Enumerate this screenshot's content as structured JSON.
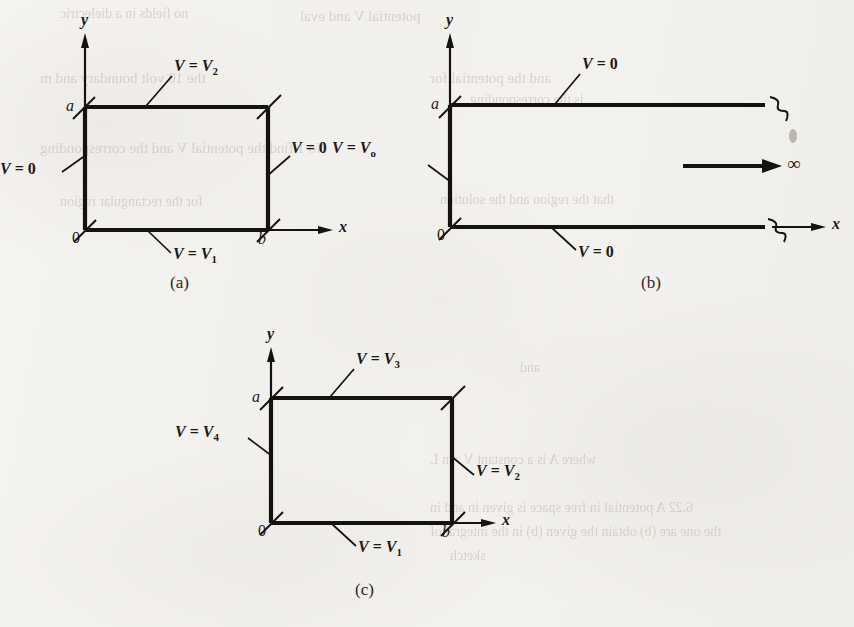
{
  "figure": {
    "type": "diagram",
    "ink_color": "#151311",
    "paper_color": "#f4f2ee"
  },
  "panels": [
    {
      "id": "a",
      "caption": "(a)",
      "axes": {
        "x_label": "x",
        "y_label": "y",
        "origin_label": "0"
      },
      "ticks": {
        "x_right": "b",
        "y_top": "a"
      },
      "region": {
        "shape": "rectangle",
        "width_symbol": "b",
        "height_symbol": "a"
      },
      "boundaries": [
        {
          "side": "bottom",
          "label_V": "V",
          "label_eq": " = ",
          "label_value": "V",
          "label_sub": "1",
          "text": "V = V1"
        },
        {
          "side": "top",
          "label_V": "V",
          "label_eq": " = ",
          "label_value": "V",
          "label_sub": "2",
          "text": "V = V2"
        },
        {
          "side": "left",
          "label_V": "V",
          "label_eq": " = ",
          "label_value": "0",
          "label_sub": "",
          "text": "V = 0"
        },
        {
          "side": "right",
          "label_V": "V",
          "label_eq": " = ",
          "label_value": "0",
          "label_sub": "",
          "text": "V = 0"
        }
      ]
    },
    {
      "id": "b",
      "caption": "(b)",
      "axes": {
        "x_label": "x",
        "y_label": "y",
        "origin_label": "0"
      },
      "ticks": {
        "x_right": "",
        "y_top": "a"
      },
      "region": {
        "shape": "semi-infinite-strip",
        "height_symbol": "a",
        "extent_label": "∞"
      },
      "boundaries": [
        {
          "side": "bottom",
          "label_V": "V",
          "label_eq": " = ",
          "label_value": "0",
          "label_sub": "",
          "text": "V = 0"
        },
        {
          "side": "top",
          "label_V": "V",
          "label_eq": " = ",
          "label_value": "0",
          "label_sub": "",
          "text": "V = 0"
        },
        {
          "side": "left",
          "label_V": "V",
          "label_eq": " = ",
          "label_value": "V",
          "label_sub": "o",
          "text": "V = Vo"
        }
      ]
    },
    {
      "id": "c",
      "caption": "(c)",
      "axes": {
        "x_label": "x",
        "y_label": "y",
        "origin_label": "0"
      },
      "ticks": {
        "x_right": "b",
        "y_top": "a"
      },
      "region": {
        "shape": "rectangle",
        "width_symbol": "b",
        "height_symbol": "a"
      },
      "boundaries": [
        {
          "side": "bottom",
          "label_V": "V",
          "label_eq": " = ",
          "label_value": "V",
          "label_sub": "1",
          "text": "V = V1"
        },
        {
          "side": "right",
          "label_V": "V",
          "label_eq": " = ",
          "label_value": "V",
          "label_sub": "2",
          "text": "V = V2"
        },
        {
          "side": "top",
          "label_V": "V",
          "label_eq": " = ",
          "label_value": "V",
          "label_sub": "3",
          "text": "V = V3"
        },
        {
          "side": "left",
          "label_V": "V",
          "label_eq": " = ",
          "label_value": "V",
          "label_sub": "4",
          "text": "V = V4"
        }
      ]
    }
  ],
  "ghost_text": [
    {
      "text": "potential V and eval",
      "x": 300,
      "y": 8,
      "size": 15
    },
    {
      "text": "no fields in a dielectric",
      "x": 60,
      "y": 6,
      "size": 14
    },
    {
      "text": "the 10 volt boundary and m",
      "x": 40,
      "y": 70,
      "size": 15
    },
    {
      "text": "and the potential for",
      "x": 430,
      "y": 70,
      "size": 15
    },
    {
      "text": "is the corresponding",
      "x": 470,
      "y": 92,
      "size": 14
    },
    {
      "text": "No 1 find the potential V and the corresponding",
      "x": 40,
      "y": 140,
      "size": 15
    },
    {
      "text": "that the region and the solution",
      "x": 440,
      "y": 192,
      "size": 14
    },
    {
      "text": "for the rectangular region",
      "x": 60,
      "y": 194,
      "size": 14
    },
    {
      "text": "and",
      "x": 520,
      "y": 360,
      "size": 14
    },
    {
      "text": "where A is a constant  V = n L",
      "x": 430,
      "y": 452,
      "size": 14
    },
    {
      "text": "6.22  A potential in free space is given in  and  in",
      "x": 430,
      "y": 500,
      "size": 14
    },
    {
      "text": "the  one  are (b)  obtain the  given (b)  in the  integral  of",
      "x": 430,
      "y": 524,
      "size": 14
    },
    {
      "text": "sketch",
      "x": 450,
      "y": 548,
      "size": 14
    }
  ]
}
